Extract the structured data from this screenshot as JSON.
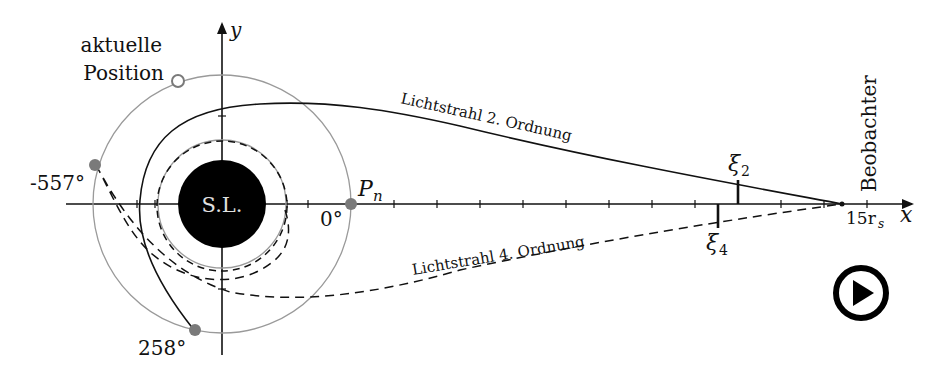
{
  "diagram": {
    "labels": {
      "current_position_line1": "aktuelle",
      "current_position_line2": "Position",
      "y_axis": "y",
      "x_axis": "x",
      "black_hole": "S.L.",
      "angle_neg557": "-557°",
      "angle_0": "0°",
      "angle_258": "258°",
      "point_pn": "P",
      "point_pn_sub": "n",
      "ray_2": "Lichtstrahl 2.  Ordnung",
      "ray_4": "Lichtstrahl 4.  Ordnung",
      "xi2": "ξ",
      "xi2_sub": "2",
      "xi4": "ξ",
      "xi4_sub": "4",
      "observer": "Beobachter",
      "observer_distance": "15r",
      "observer_distance_sub": "s"
    },
    "colors": {
      "line": "#111111",
      "orbit_gray": "#9a9a9a",
      "marker_gray": "#7a7a7a",
      "black_hole": "#000000",
      "black_hole_label": "#e0e0e0"
    }
  },
  "controls": {
    "play_button": {
      "icon": "play-icon",
      "label": "Play"
    }
  }
}
